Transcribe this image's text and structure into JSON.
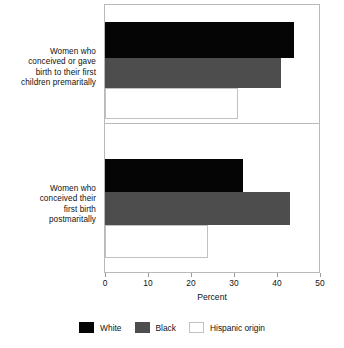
{
  "chart_data": {
    "type": "bar",
    "orientation": "horizontal",
    "title": "",
    "subtitle": "",
    "xlabel": "Percent",
    "ylabel": "",
    "xlim": [
      0,
      50
    ],
    "xticks": [
      0,
      10,
      20,
      30,
      40,
      50
    ],
    "xticklabels": [
      "0",
      "10",
      "20",
      "30",
      "40",
      "50"
    ],
    "grid": false,
    "legend_position": "bottom",
    "categories": [
      "Women who conceived or gave birth to their first children premaritally",
      "Women who conceived their first birth postmaritally"
    ],
    "category_lines": [
      [
        "Women who",
        "conceived or gave",
        "birth to their first",
        "children premaritally"
      ],
      [
        "Women who",
        "conceived their",
        "first birth",
        "postmaritally"
      ]
    ],
    "series": [
      {
        "name": "White",
        "color": "#050505",
        "values": [
          44,
          32
        ]
      },
      {
        "name": "Black",
        "color": "#4d4d4d",
        "values": [
          41,
          43
        ]
      },
      {
        "name": "Hispanic origin",
        "color": "#ffffff",
        "values": [
          31,
          24
        ]
      }
    ]
  },
  "axis": {
    "title": "Percent",
    "ticks": [
      "0",
      "10",
      "20",
      "30",
      "40",
      "50"
    ]
  },
  "legend": {
    "items": [
      {
        "label": "White",
        "swatch": "solid-black-swatch"
      },
      {
        "label": "Black",
        "swatch": "solid-gray-swatch"
      },
      {
        "label": "Hispanic origin",
        "swatch": "outlined-white-swatch"
      }
    ]
  },
  "groups": [
    {
      "label_lines": [
        "Women who",
        "conceived or gave",
        "birth to their first",
        "children premaritally"
      ],
      "bars": [
        {
          "series": "White",
          "value": 44
        },
        {
          "series": "Black",
          "value": 41
        },
        {
          "series": "Hispanic origin",
          "value": 31
        }
      ]
    },
    {
      "label_lines": [
        "Women who",
        "conceived their",
        "first birth",
        "postmaritally"
      ],
      "bars": [
        {
          "series": "White",
          "value": 32
        },
        {
          "series": "Black",
          "value": 43
        },
        {
          "series": "Hispanic origin",
          "value": 24
        }
      ]
    }
  ]
}
